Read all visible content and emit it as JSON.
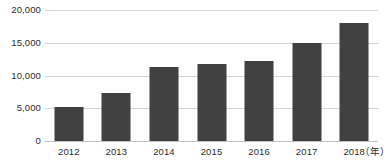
{
  "chart_data": {
    "type": "bar",
    "title": "",
    "subtitle": "",
    "xlabel": "",
    "ylabel": "",
    "x_unit_label": "（年）",
    "categories": [
      "2012",
      "2013",
      "2014",
      "2015",
      "2016",
      "2017",
      "2018"
    ],
    "values": [
      5200,
      7300,
      11300,
      11800,
      12200,
      15000,
      18000
    ],
    "series": [
      {
        "name": "",
        "values": [
          5200,
          7300,
          11300,
          11800,
          12200,
          15000,
          18000
        ],
        "color": "#414141"
      }
    ],
    "ylim": [
      0,
      20000
    ],
    "y_ticks": [
      0,
      5000,
      10000,
      15000,
      20000
    ],
    "y_tick_labels": [
      "0",
      "5,000",
      "10,000",
      "15,000",
      "20,000"
    ],
    "grid": true,
    "grid_color": "#d4d4d4",
    "legend": false,
    "legend_position": "none",
    "background_color": "#ffffff",
    "text_color": "#2b2b2b"
  }
}
